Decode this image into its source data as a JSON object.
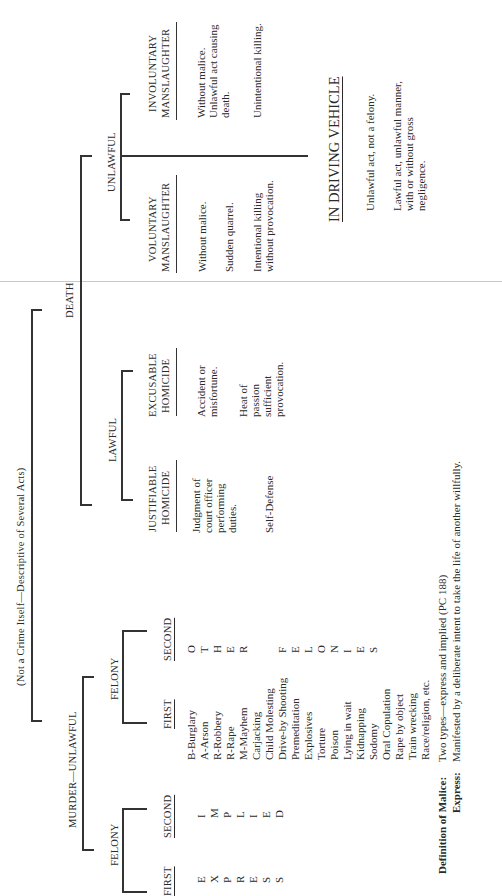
{
  "document": {
    "root_note": "(Not a Crime Itself—Descriptive of Several Acts)",
    "death": "DEATH",
    "murder": {
      "label": "MURDER—UNLAWFUL",
      "malice_felony": {
        "label": "FELONY",
        "first": {
          "header": "FIRST",
          "letters": [
            "E",
            "X",
            "P",
            "R",
            "E",
            "S",
            "S"
          ]
        },
        "second": {
          "header": "SECOND",
          "letters": [
            "I",
            "M",
            "P",
            "L",
            "I",
            "E",
            "D"
          ]
        }
      },
      "felony": {
        "label": "FELONY",
        "first": {
          "header": "FIRST",
          "items": [
            "B-Burglary",
            "A-Arson",
            "R-Robbery",
            "R-Rape",
            "M-Mayhem",
            "Carjacking",
            "Child Molesting",
            "Drive-by Shooting",
            "Premeditation",
            "Explosives",
            "Torture",
            "Poison",
            "Lying in wait",
            "Kidnapping",
            "Sodomy",
            "Oral Copulation",
            "Rape by object",
            "Train wrecking",
            "Race/religion, etc."
          ]
        },
        "second": {
          "header": "SECOND",
          "letters_other": [
            "O",
            "T",
            "H",
            "E",
            "R"
          ],
          "letters_felonies": [
            "F",
            "E",
            "L",
            "O",
            "N",
            "I",
            "E",
            "S"
          ]
        }
      }
    },
    "lawful": {
      "label": "LAWFUL",
      "justifiable": {
        "header_line1": "JUSTIFIABLE",
        "header_line2": "HOMICIDE",
        "item1": "Judgment of\ncourt officer\nperforming\nduties.",
        "item2": "Self-Defense"
      },
      "excusable": {
        "header_line1": "EXCUSABLE",
        "header_line2": "HOMICIDE",
        "item1": "Accident or\nmisfortune.",
        "item2": "Heat of\npassion\nsufficient\nprovocation."
      }
    },
    "unlawful": {
      "label": "UNLAWFUL",
      "voluntary": {
        "header_line1": "VOLUNTARY",
        "header_line2": "MANSLAUGHTER",
        "item1": "Without malice.",
        "item2": "Sudden quarrel.",
        "item3": "Intentional killing\nwithout provocation."
      },
      "involuntary": {
        "header_line1": "INVOLUNTARY",
        "header_line2": "MANSLAUGHTER",
        "item1": "Without malice.\nUnlawful act causing\ndeath.",
        "item2": "Unintentional killing."
      },
      "vehicle": {
        "header": "IN DRIVING VEHICLE",
        "item1": "Unlawful act, not a felony.",
        "item2": "Lawful act, unlawful manner,\nwith or without gross\nnegligence."
      }
    },
    "malice_definition": {
      "label": "Definition of Malice:",
      "value": "Two types—express and implied (PC 188)",
      "express_label": "Express:",
      "express_value": "Manifested by a deliberate intent to take the life of another willfully."
    }
  }
}
